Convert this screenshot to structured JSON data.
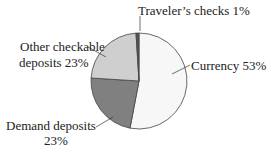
{
  "chart_data": {
    "type": "pie",
    "title": "",
    "categories": [
      "Currency",
      "Traveler's checks",
      "Other checkable deposits",
      "Demand deposits"
    ],
    "values": [
      53,
      1,
      23,
      23
    ],
    "unit": "%",
    "colors": [
      "#f7f7f7",
      "#555555",
      "#cfcfcf",
      "#808080"
    ],
    "labels": {
      "currency": "Currency 53%",
      "travelers": "Traveler’s checks 1%",
      "other_line1": "Other checkable",
      "other_line2": "deposits 23%",
      "demand_line1": "Demand deposits",
      "demand_line2": "23%"
    },
    "legend": "none (leader-line labels)"
  }
}
